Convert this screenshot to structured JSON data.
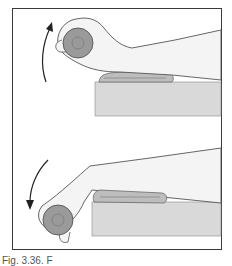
{
  "figure": {
    "panels": [
      {
        "id": "top",
        "description": "Wrist extension: forearm resting on a rolled towel atop a table, hand holding a dumbbell raised upward",
        "motion_arrow": "upward"
      },
      {
        "id": "bottom",
        "description": "Wrist flexion downward: forearm resting on a rolled towel atop a table, hand holding a dumbbell lowered",
        "motion_arrow": "downward"
      }
    ],
    "colors": {
      "frame": "#3a3a3a",
      "skin_fill": "#f4f4f4",
      "outline": "#555555",
      "table": "#d9d9d9",
      "towel": "#bdbdbd",
      "weight": "#9a9a9a",
      "arrow": "#222222"
    }
  },
  "caption": {
    "text": "Fig. 3.36. F"
  }
}
